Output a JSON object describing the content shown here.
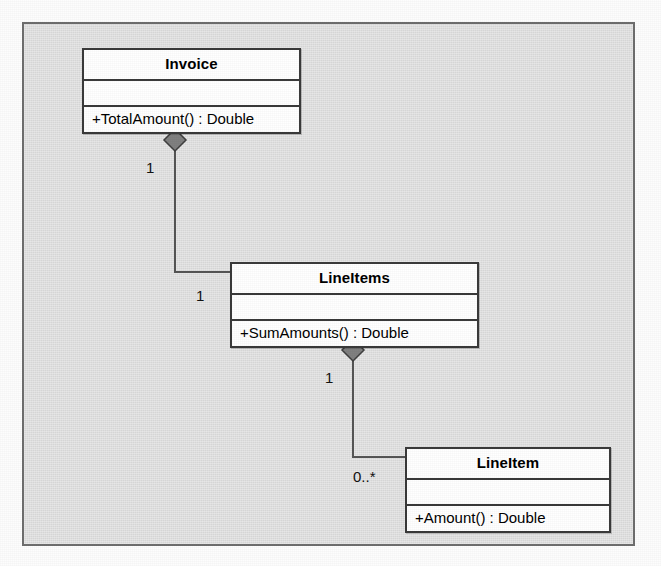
{
  "diagram": {
    "kind": "uml-class-diagram",
    "colors": {
      "page_background": "#fdfdfd",
      "frame_fill": "#d9d9d9",
      "frame_border": "#6e6e6e",
      "class_fill": "#ffffff",
      "class_border": "#3a3a3a",
      "connector": "#555555",
      "diamond_fill": "#808080",
      "diamond_border": "#3f3f3f",
      "text": "#000000"
    },
    "classes": [
      {
        "id": "invoice",
        "name": "Invoice",
        "attributes": [],
        "operations": [
          "+TotalAmount() : Double"
        ]
      },
      {
        "id": "lineitems",
        "name": "LineItems",
        "attributes": [],
        "operations": [
          "+SumAmounts() : Double"
        ]
      },
      {
        "id": "lineitem",
        "name": "LineItem",
        "attributes": [],
        "operations": [
          "+Amount() : Double"
        ]
      }
    ],
    "relationships": [
      {
        "id": "invoice-lineitems",
        "type": "composition",
        "from": "Invoice",
        "to": "LineItems",
        "source_multiplicity": "1",
        "target_multiplicity": "1",
        "diamond_at": "Invoice"
      },
      {
        "id": "lineitems-lineitem",
        "type": "composition",
        "from": "LineItems",
        "to": "LineItem",
        "source_multiplicity": "1",
        "target_multiplicity": "0..*",
        "diamond_at": "LineItems"
      }
    ]
  }
}
